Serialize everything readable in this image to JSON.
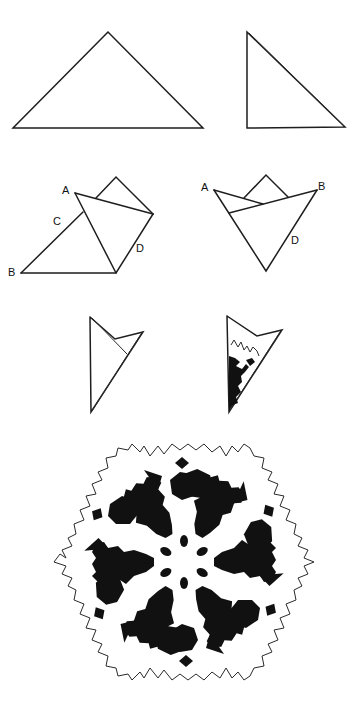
{
  "figure": {
    "ink_color": "#111111",
    "background": "#ffffff"
  },
  "steps": [
    {
      "id": "step-1",
      "description": "Square folded in half diagonally into a large triangle",
      "polygon": "108,32 13,128 203,128"
    },
    {
      "id": "step-2",
      "description": "Triangle folded in half into a smaller right triangle",
      "polygon": "247,32 247,128 345,127",
      "double_edge": "249,33 344,126"
    },
    {
      "id": "step-3",
      "description": "Corner A folded toward D, point B remains",
      "labels": [
        {
          "text": "A",
          "x": 62,
          "y": 185
        },
        {
          "text": "C",
          "x": 53,
          "y": 216
        },
        {
          "text": "B",
          "x": 8,
          "y": 267
        },
        {
          "text": "D",
          "x": 136,
          "y": 243
        }
      ]
    },
    {
      "id": "step-4",
      "description": "Corner B folded over to match; cone shape with points A and B",
      "labels": [
        {
          "text": "A",
          "x": 201,
          "y": 182
        },
        {
          "text": "B",
          "x": 318,
          "y": 181
        },
        {
          "text": "D",
          "x": 291,
          "y": 235
        }
      ]
    },
    {
      "id": "step-5",
      "description": "Top trimmed; folded wedge ready for cutting"
    },
    {
      "id": "step-6",
      "description": "Wedge with cut-out pattern shaded"
    },
    {
      "id": "step-7",
      "description": "Unfolded finished six-pointed paper snowflake"
    }
  ]
}
